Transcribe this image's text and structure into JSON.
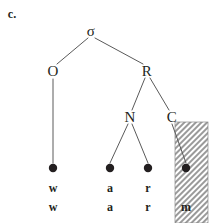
{
  "figure": {
    "item_label": "c.",
    "type": "syllable-structure-tree",
    "nodes": [
      {
        "id": "sigma",
        "label": "σ",
        "x": 91,
        "y": 31,
        "name": "node-sigma"
      },
      {
        "id": "onset",
        "label": "O",
        "x": 53,
        "y": 71,
        "name": "node-onset"
      },
      {
        "id": "rhyme",
        "label": "R",
        "x": 147,
        "y": 71,
        "name": "node-rhyme"
      },
      {
        "id": "nucleus",
        "label": "N",
        "x": 130,
        "y": 117,
        "name": "node-nucleus"
      },
      {
        "id": "coda",
        "label": "C",
        "x": 172,
        "y": 117,
        "name": "node-coda"
      }
    ],
    "edges": [
      {
        "from": "sigma",
        "to": "onset",
        "x1": 88,
        "y1": 38,
        "x2": 57,
        "y2": 64
      },
      {
        "from": "sigma",
        "to": "rhyme",
        "x1": 95,
        "y1": 38,
        "x2": 143,
        "y2": 64
      },
      {
        "from": "rhyme",
        "to": "nucleus",
        "x1": 145,
        "y1": 78,
        "x2": 132,
        "y2": 110
      },
      {
        "from": "rhyme",
        "to": "coda",
        "x1": 150,
        "y1": 78,
        "x2": 169,
        "y2": 110
      },
      {
        "from": "onset",
        "to": "slot1",
        "x1": 53,
        "y1": 79,
        "x2": 53,
        "y2": 163
      },
      {
        "from": "nucleus",
        "to": "slot2",
        "x1": 128,
        "y1": 124,
        "x2": 110,
        "y2": 163
      },
      {
        "from": "nucleus",
        "to": "slot3",
        "x1": 132,
        "y1": 124,
        "x2": 148,
        "y2": 163
      },
      {
        "from": "coda",
        "to": "slot4",
        "x1": 172,
        "y1": 124,
        "x2": 186,
        "y2": 163
      }
    ],
    "timing_slots": [
      {
        "id": "slot1",
        "x": 53,
        "y": 168,
        "name": "timing-slot-1"
      },
      {
        "id": "slot2",
        "x": 110,
        "y": 168,
        "name": "timing-slot-2"
      },
      {
        "id": "slot3",
        "x": 148,
        "y": 168,
        "name": "timing-slot-3"
      },
      {
        "id": "slot4",
        "x": 186,
        "y": 168,
        "name": "timing-slot-4"
      }
    ],
    "melody_row": [
      {
        "text": "w",
        "x": 53,
        "y": 188
      },
      {
        "text": "a",
        "x": 110,
        "y": 188
      },
      {
        "text": "r",
        "x": 148,
        "y": 188
      },
      {
        "text": "",
        "x": 186,
        "y": 188
      }
    ],
    "surface_row": [
      {
        "text": "w",
        "x": 53,
        "y": 207
      },
      {
        "text": "a",
        "x": 110,
        "y": 207
      },
      {
        "text": "r",
        "x": 148,
        "y": 207
      },
      {
        "text": "m",
        "x": 186,
        "y": 207
      }
    ],
    "shaded_region": {
      "x": 175,
      "y": 122,
      "width": 33,
      "height": 101,
      "name": "shaded-coda-region"
    },
    "colors": {
      "ink": "#231f20",
      "line": "#5a5a5a",
      "shading": "#b8b8b8",
      "background": "#ffffff"
    }
  }
}
